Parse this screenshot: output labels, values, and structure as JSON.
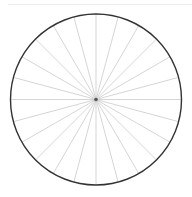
{
  "diagram": {
    "type": "radial-wheel",
    "center": [
      96,
      99.5
    ],
    "radius": 85.5,
    "spoke_count": 24,
    "spoke_angle_step_deg": 15,
    "colors": {
      "circle": "#333333",
      "spokes": "#d0d0d0",
      "hub": "#555555",
      "background": "#ffffff",
      "top_rule": "#ececec"
    }
  }
}
